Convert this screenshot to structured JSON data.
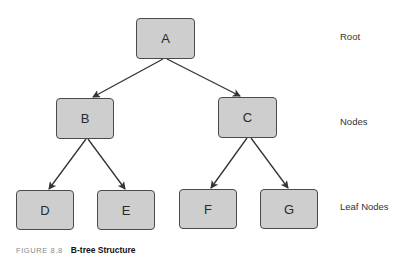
{
  "diagram": {
    "type": "tree",
    "nodes": [
      {
        "id": "A",
        "label": "A",
        "level": "root",
        "x": 136,
        "y": 18,
        "w": 59,
        "h": 41
      },
      {
        "id": "B",
        "label": "B",
        "level": "nodes",
        "x": 56,
        "y": 98,
        "w": 58,
        "h": 41
      },
      {
        "id": "C",
        "label": "C",
        "level": "nodes",
        "x": 218,
        "y": 97,
        "w": 59,
        "h": 41
      },
      {
        "id": "D",
        "label": "D",
        "level": "leaf",
        "x": 16,
        "y": 190,
        "w": 58,
        "h": 40
      },
      {
        "id": "E",
        "label": "E",
        "level": "leaf",
        "x": 97,
        "y": 190,
        "w": 58,
        "h": 40
      },
      {
        "id": "F",
        "label": "F",
        "level": "leaf",
        "x": 179,
        "y": 189,
        "w": 58,
        "h": 40
      },
      {
        "id": "G",
        "label": "G",
        "level": "leaf",
        "x": 260,
        "y": 189,
        "w": 58,
        "h": 40
      }
    ],
    "edges": [
      {
        "from": "A",
        "to": "B",
        "x1": 163,
        "y1": 59,
        "x2": 93,
        "y2": 97
      },
      {
        "from": "A",
        "to": "C",
        "x1": 167,
        "y1": 59,
        "x2": 240,
        "y2": 96
      },
      {
        "from": "B",
        "to": "D",
        "x1": 86,
        "y1": 139,
        "x2": 49,
        "y2": 189
      },
      {
        "from": "B",
        "to": "E",
        "x1": 88,
        "y1": 139,
        "x2": 125,
        "y2": 189
      },
      {
        "from": "C",
        "to": "F",
        "x1": 247,
        "y1": 138,
        "x2": 211,
        "y2": 188
      },
      {
        "from": "C",
        "to": "G",
        "x1": 251,
        "y1": 138,
        "x2": 288,
        "y2": 188
      }
    ],
    "level_labels": {
      "root": "Root",
      "nodes": "Nodes",
      "leaf": "Leaf Nodes"
    },
    "colors": {
      "node_fill": "#cecece",
      "node_border": "#4a4a4a",
      "edge": "#333333"
    }
  },
  "caption": {
    "figure_number": "FIGURE 8.8",
    "title": "B-tree Structure"
  }
}
